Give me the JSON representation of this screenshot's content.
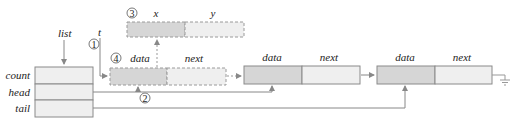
{
  "diagram": {
    "list_struct": {
      "pointer_label": "list",
      "fields": [
        "count",
        "head",
        "tail"
      ]
    },
    "temp_pointer_label": "t",
    "new_node": {
      "fields": [
        "data",
        "next"
      ],
      "style": "dashed"
    },
    "payload": {
      "fields": [
        "x",
        "y"
      ],
      "style": "dashed"
    },
    "nodes": [
      {
        "fields": [
          "data",
          "next"
        ]
      },
      {
        "fields": [
          "data",
          "next"
        ],
        "terminator": "null-ground"
      }
    ],
    "steps": [
      "①",
      "②",
      "③",
      "④"
    ],
    "colors": {
      "data_fill": "#d6d6d6",
      "next_fill": "#efefef",
      "struct_fill": "#efefef",
      "line": "#8a8a8a",
      "dashed": "#9a9a9a"
    }
  }
}
